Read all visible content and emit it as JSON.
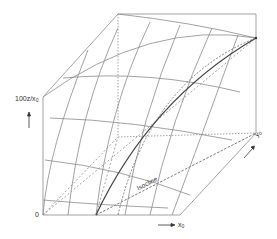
{
  "figure": {
    "type": "3d-surface-schematic",
    "labels": {
      "vertical_axis": "100z/x",
      "vertical_axis_sub": "0",
      "origin": "0",
      "x_axis": "x",
      "x_axis_sub": "0",
      "y_axis": "y",
      "y_axis_sub": "0",
      "isocline": "Isocline"
    },
    "colors": {
      "line": "#8a8a8a",
      "curve": "#444444",
      "text": "#333333",
      "background": "#ffffff"
    }
  }
}
